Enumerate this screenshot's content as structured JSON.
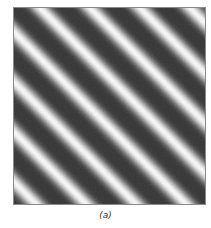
{
  "figure": {
    "caption": "(a)",
    "grating": {
      "period_px_along_axis": 50,
      "orientation": "diagonal, descending left-to-right (phase varies with x - y)",
      "bright_band_offset": 32,
      "dark_gray": "#3a3a3a",
      "light_gray": "#f6f6f6",
      "sharpness": 2.2
    },
    "frame": {
      "border_color": "#8a8a8a"
    }
  }
}
